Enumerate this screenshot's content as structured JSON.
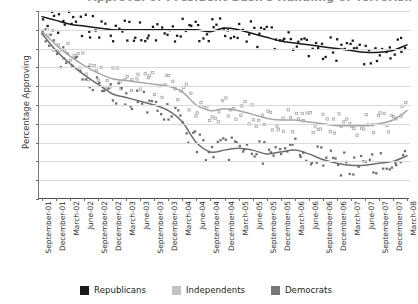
{
  "chart_data": {
    "type": "scatter",
    "title": "Approval of President Bush's Handling of Terrorism",
    "title_visible": "partially cropped at top edge",
    "xlabel": "",
    "ylabel": "Percentage Approving",
    "ylim": [
      0,
      100
    ],
    "ytick_values": [
      0,
      10,
      20,
      30,
      40,
      50,
      60,
      70,
      80,
      90,
      100
    ],
    "grid": "horizontal",
    "legend_position": "bottom-center",
    "categories": [
      "September-01",
      "December-01",
      "March-02",
      "June-02",
      "September-02",
      "December-02",
      "March-03",
      "June-03",
      "September-03",
      "December-03",
      "March-04",
      "June-04",
      "September-04",
      "December-04",
      "March-05",
      "June-05",
      "September-05",
      "December-05",
      "March-06",
      "June-06",
      "September-06",
      "December-06",
      "March-07",
      "June-07",
      "September-07",
      "December-07",
      "March-08"
    ],
    "series": [
      {
        "name": "Republicans",
        "color": "#1a1a1a",
        "marker": "filled-square",
        "trend_values": [
          97,
          95,
          93,
          92,
          91,
          90,
          90,
          90,
          90,
          90,
          90,
          90,
          89,
          91,
          90,
          88,
          86,
          84,
          83,
          82,
          81,
          80,
          79,
          78,
          78,
          79,
          82
        ]
      },
      {
        "name": "Independents",
        "color": "#a6a6a6",
        "marker": "open-square",
        "trend_values": [
          89,
          82,
          76,
          71,
          67,
          64,
          63,
          62,
          61,
          60,
          57,
          50,
          47,
          48,
          47,
          45,
          43,
          42,
          42,
          41,
          40,
          39,
          39,
          39,
          40,
          42,
          47
        ]
      },
      {
        "name": "Democrats",
        "color": "#6e6e6e",
        "marker": "filled-square",
        "trend_values": [
          88,
          79,
          72,
          66,
          61,
          56,
          54,
          52,
          50,
          47,
          41,
          30,
          25,
          26,
          27,
          26,
          24,
          25,
          26,
          24,
          21,
          19,
          18,
          18,
          19,
          20,
          23
        ]
      }
    ]
  },
  "legend": {
    "items": [
      {
        "label": "Republicans",
        "color": "#1a1a1a"
      },
      {
        "label": "Independents",
        "color": "#c2c2c2"
      },
      {
        "label": "Democrats",
        "color": "#777777"
      }
    ]
  }
}
